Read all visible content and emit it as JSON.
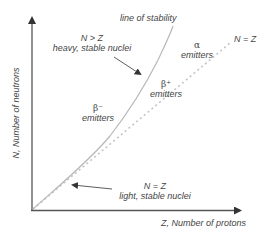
{
  "diagram": {
    "axes": {
      "x_label": "Z, Number of protons",
      "y_label": "N, Number of neutrons"
    },
    "lines": {
      "stability_label": "line of stability",
      "nz_label": "N = Z"
    },
    "annotations": {
      "heavy_title": "N > Z",
      "heavy_sub": "heavy, stable nuclei",
      "light_title": "N = Z",
      "light_sub": "light, stable nuclei"
    },
    "regions": {
      "alpha_symbol": "α",
      "alpha_label": "emitters",
      "beta_plus_symbol": "β⁺",
      "beta_plus_label": "emitters",
      "beta_minus_symbol": "β⁻",
      "beta_minus_label": "emitters"
    },
    "colors": {
      "axis": "#555555",
      "stability_curve": "#b8b8b8",
      "nz_dashed": "#c4c4c4",
      "arrow": "#333333",
      "text": "#444444"
    }
  }
}
